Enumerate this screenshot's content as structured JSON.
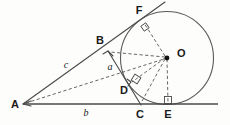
{
  "diagram": {
    "type": "geometry",
    "canvas": {
      "width": 230,
      "height": 125
    },
    "colors": {
      "stroke": "#4a4a4a",
      "dashed": "#555555",
      "arc": "#5a5a5a",
      "label": "#1a1a1a",
      "background": "#fdfdfc"
    },
    "points": [
      {
        "id": "A",
        "label": "A",
        "x": 23,
        "y": 104,
        "label_x": 15,
        "label_y": 108,
        "kind": "vertex"
      },
      {
        "id": "B",
        "label": "B",
        "x": 108,
        "y": 51,
        "label_x": 100,
        "label_y": 44,
        "kind": "vertex"
      },
      {
        "id": "C",
        "label": "C",
        "x": 140,
        "y": 104,
        "label_x": 140,
        "label_y": 118,
        "kind": "vertex"
      },
      {
        "id": "D",
        "label": "D",
        "x": 131,
        "y": 82,
        "label_x": 124,
        "label_y": 94,
        "kind": "tangent-point"
      },
      {
        "id": "E",
        "label": "E",
        "x": 168,
        "y": 104,
        "label_x": 168,
        "label_y": 118,
        "kind": "tangent-point"
      },
      {
        "id": "F",
        "label": "F",
        "x": 143,
        "y": 22,
        "label_x": 139,
        "label_y": 14,
        "kind": "tangent-point"
      },
      {
        "id": "O",
        "label": "O",
        "x": 167,
        "y": 58,
        "label_x": 177,
        "label_y": 57,
        "kind": "center"
      }
    ],
    "side_labels": [
      {
        "id": "a",
        "label": "a",
        "x": 110,
        "y": 70,
        "describes": "segment-BC"
      },
      {
        "id": "b",
        "label": "b",
        "x": 86,
        "y": 116,
        "describes": "segment-AC"
      },
      {
        "id": "c",
        "label": "c",
        "x": 66,
        "y": 68,
        "describes": "segment-AB"
      }
    ],
    "circle": {
      "cx": 167,
      "cy": 58,
      "r": 46.5
    },
    "solid_segments": [
      {
        "id": "baseline-A-to-right",
        "x1": 23,
        "y1": 104,
        "x2": 218,
        "y2": 104
      },
      {
        "id": "ray-A-through-B-to-F",
        "x1": 23,
        "y1": 104,
        "x2": 165,
        "y2": 2
      },
      {
        "id": "segment-B-to-C",
        "x1": 108,
        "y1": 51,
        "x2": 141,
        "y2": 105
      }
    ],
    "dashed_segments": [
      {
        "id": "A-to-O",
        "x1": 26,
        "y1": 103,
        "x2": 164,
        "y2": 59
      },
      {
        "id": "O-to-B",
        "x1": 165,
        "y1": 57,
        "x2": 110,
        "y2": 52
      },
      {
        "id": "O-to-D",
        "x1": 165,
        "y1": 58,
        "x2": 132,
        "y2": 82
      },
      {
        "id": "O-to-C",
        "x1": 165,
        "y1": 59,
        "x2": 141,
        "y2": 103
      },
      {
        "id": "O-to-E",
        "x1": 167,
        "y1": 59,
        "x2": 168,
        "y2": 103
      },
      {
        "id": "O-to-F",
        "x1": 165,
        "y1": 56,
        "x2": 144,
        "y2": 23
      }
    ],
    "right_angles": [
      {
        "id": "right-angle-at-F",
        "cx": 145,
        "cy": 27,
        "rot": -35
      },
      {
        "id": "right-angle-at-D",
        "cx": 136,
        "cy": 79,
        "rot": 32
      },
      {
        "id": "right-angle-at-E",
        "cx": 168,
        "cy": 100,
        "rot": 0
      }
    ],
    "arrow_marks": [
      {
        "id": "arrowhead-at-A",
        "x": 26,
        "y": 104
      },
      {
        "id": "arrowhead-at-B",
        "x": 108,
        "y": 51
      },
      {
        "id": "arrowhead-at-O",
        "x": 167,
        "y": 58
      }
    ]
  }
}
